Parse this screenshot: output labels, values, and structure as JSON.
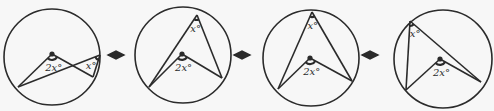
{
  "figure": {
    "stroke_color": "#2b2b2b",
    "background": "#f7f7f7",
    "arrow_symbol": "↔",
    "panels": [
      {
        "id": 1,
        "inscribed_label": "x°",
        "central_label": "2x°",
        "circle": {
          "cx": 52,
          "cy": 57,
          "r": 48
        },
        "center_dot": {
          "x": 52,
          "y": 54
        },
        "vertex": {
          "x": 100,
          "y": 55
        },
        "arc_a": {
          "x": 18,
          "y": 87
        },
        "arc_b": {
          "x": 93,
          "y": 77
        }
      },
      {
        "id": 2,
        "inscribed_label": "x°",
        "central_label": "2x°",
        "circle": {
          "cx": 183,
          "cy": 55,
          "r": 48
        },
        "center_dot": {
          "x": 182,
          "y": 54
        },
        "vertex": {
          "x": 197,
          "y": 15
        },
        "arc_a": {
          "x": 149,
          "y": 87
        },
        "arc_b": {
          "x": 222,
          "y": 78
        }
      },
      {
        "id": 3,
        "inscribed_label": "x°",
        "central_label": "2x°",
        "circle": {
          "cx": 311,
          "cy": 58,
          "r": 48
        },
        "center_dot": {
          "x": 310,
          "y": 58
        },
        "vertex": {
          "x": 312,
          "y": 12
        },
        "arc_a": {
          "x": 278,
          "y": 89
        },
        "arc_b": {
          "x": 352,
          "y": 81
        }
      },
      {
        "id": 4,
        "inscribed_label": "x°",
        "central_label": "2x°",
        "circle": {
          "cx": 443,
          "cy": 59,
          "r": 49
        },
        "center_dot": {
          "x": 440,
          "y": 59
        },
        "vertex": {
          "x": 410,
          "y": 21
        },
        "arc_a": {
          "x": 406,
          "y": 90
        },
        "arc_b": {
          "x": 481,
          "y": 82
        }
      }
    ]
  }
}
